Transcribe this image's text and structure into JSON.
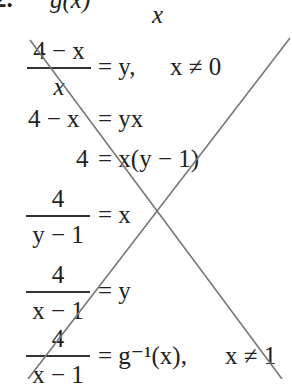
{
  "header": {
    "problem_label": "2.",
    "function_fragment": "g(x)",
    "denominator_fragment": "x"
  },
  "steps": [
    {
      "num": "4 − x",
      "den": "x",
      "rhs": "= y,",
      "condition": "x ≠ 0"
    },
    {
      "text_left": "4 − x",
      "text_right": "= yx"
    },
    {
      "text_left": "4",
      "text_right": "= x(y − 1)"
    },
    {
      "num": "4",
      "den": "y − 1",
      "rhs": "= x"
    },
    {
      "num": "4",
      "den": "x − 1",
      "rhs": "= y"
    },
    {
      "num": "4",
      "den": "x − 1",
      "rhs": "= g⁻¹(x),",
      "condition": "x ≠ 1"
    }
  ],
  "cross_out": {
    "color": "#777777",
    "line1": [
      30,
      40,
      282,
      379
    ],
    "line2": [
      290,
      38,
      28,
      379
    ]
  }
}
